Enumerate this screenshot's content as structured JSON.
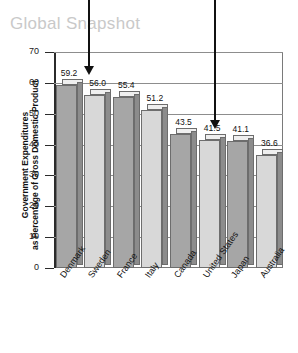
{
  "title": "Global Snapshot",
  "chart_data": {
    "type": "bar",
    "title": "Global Snapshot",
    "xlabel": "",
    "ylabel": "Government Expenditures as Percentage of Gross Domestic Product",
    "ylabel_line1": "Government Expenditures",
    "ylabel_line2": "as Percentage of Gross Domestic Product",
    "ylim": [
      0,
      70
    ],
    "ytick_step": 10,
    "grid": true,
    "legend": "none",
    "categories": [
      "Denmark",
      "Sweden",
      "France",
      "Italy",
      "Canada",
      "United States",
      "Japan",
      "Australia"
    ],
    "values": [
      59.2,
      56.0,
      55.4,
      51.2,
      43.5,
      41.5,
      41.1,
      36.6
    ],
    "value_labels": [
      "59.2",
      "56.0",
      "55.4",
      "51.2",
      "43.5",
      "41.5",
      "41.1",
      "36.6"
    ],
    "yticks": [
      "0",
      "10",
      "20",
      "30",
      "40",
      "50",
      "60",
      "70"
    ]
  },
  "annotations": [
    {
      "name": "arrow-left",
      "target": "Denmark"
    },
    {
      "name": "arrow-right",
      "target": "United States"
    }
  ]
}
